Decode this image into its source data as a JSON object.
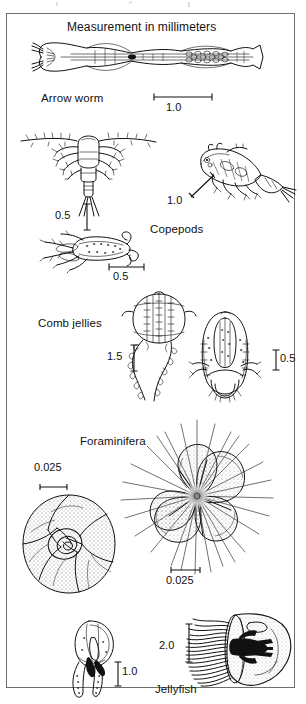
{
  "plate": {
    "title": "Measurement in millimeters",
    "groups": [
      {
        "name": "arrow-worm",
        "label": "Arrow worm",
        "organisms": [
          {
            "name": "arrow-worm-specimen",
            "scale": "1.0",
            "scale_orientation": "horizontal"
          }
        ]
      },
      {
        "name": "copepods",
        "label": "Copepods",
        "organisms": [
          {
            "name": "copepod-antennae-specimen",
            "scale": "0.5",
            "scale_orientation": "vertical"
          },
          {
            "name": "copepod-lateral-specimen",
            "scale": "1.0",
            "scale_orientation": "diagonal"
          },
          {
            "name": "copepod-dorsal-specimen",
            "scale": "0.5",
            "scale_orientation": "horizontal"
          }
        ]
      },
      {
        "name": "comb-jellies",
        "label": "Comb jellies",
        "organisms": [
          {
            "name": "comb-jelly-tentaculate-specimen",
            "scale": "1.5",
            "scale_orientation": "vertical"
          },
          {
            "name": "comb-jelly-lobate-specimen",
            "scale": "0.5",
            "scale_orientation": "vertical"
          }
        ]
      },
      {
        "name": "foraminifera",
        "label": "Foraminifera",
        "organisms": [
          {
            "name": "foraminifera-spiral-specimen",
            "scale": "0.025",
            "scale_orientation": "horizontal"
          },
          {
            "name": "foraminifera-spinose-specimen",
            "scale": "0.025",
            "scale_orientation": "horizontal"
          }
        ]
      },
      {
        "name": "jellyfish",
        "label": "Jellyfish",
        "organisms": [
          {
            "name": "jellyfish-small-specimen",
            "scale": "1.0",
            "scale_orientation": "vertical"
          },
          {
            "name": "jellyfish-large-specimen",
            "scale": "2.0",
            "scale_orientation": "vertical"
          }
        ]
      }
    ]
  },
  "style": {
    "ink": "#111111",
    "frame": "#6e6e6e",
    "paper": "#ffffff"
  }
}
